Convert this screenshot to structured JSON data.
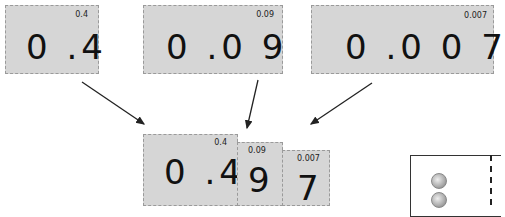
{
  "top_cards": [
    {
      "label": "0.4",
      "big": "0 .4"
    },
    {
      "label": "0.09",
      "big": "0 .0 9"
    },
    {
      "label": "0.007",
      "big": "0 .0 0 7"
    }
  ],
  "bottom_cards": [
    {
      "label": "0.4",
      "big": "0 .4"
    },
    {
      "label": "0.09",
      "big": "9"
    },
    {
      "label": "0.007",
      "big": "7"
    }
  ],
  "colors": {
    "card": "#d6d6d6",
    "border": "#9a9a9a",
    "arrow": "#222222"
  }
}
